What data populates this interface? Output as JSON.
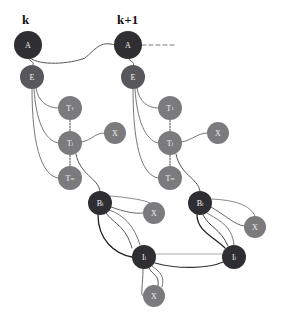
{
  "diagram": {
    "columns": [
      {
        "label": "k",
        "x": 28
      },
      {
        "label": "k+1",
        "x": 128
      }
    ],
    "colors": {
      "dark": "#2f2f33",
      "mid": "#58585c",
      "grey": "#7b7b7e",
      "edge": "#444444",
      "edge_light": "#8a8a8a"
    },
    "nodes": [
      {
        "id": "A_k",
        "label": "A",
        "sup": "",
        "x": 28,
        "y": 45,
        "r": 14,
        "tone": "dark"
      },
      {
        "id": "E_k",
        "label": "E",
        "sup": "",
        "x": 32,
        "y": 77,
        "r": 12,
        "tone": "mid"
      },
      {
        "id": "T1_k",
        "label": "T",
        "sup": "1",
        "x": 70,
        "y": 108,
        "r": 12,
        "tone": "grey"
      },
      {
        "id": "Tj_k",
        "label": "T",
        "sup": "j",
        "x": 70,
        "y": 143,
        "r": 12,
        "tone": "grey"
      },
      {
        "id": "X1_k",
        "label": "X",
        "sup": "",
        "x": 115,
        "y": 133,
        "r": 11,
        "tone": "grey"
      },
      {
        "id": "Tm_k",
        "label": "T",
        "sup": "m",
        "x": 70,
        "y": 178,
        "r": 12,
        "tone": "grey"
      },
      {
        "id": "Bj_k",
        "label": "B",
        "sup": "j",
        "x": 100,
        "y": 203,
        "r": 12,
        "tone": "dark"
      },
      {
        "id": "X2_k",
        "label": "X",
        "sup": "",
        "x": 154,
        "y": 213,
        "r": 11,
        "tone": "grey"
      },
      {
        "id": "Ij_k",
        "label": "I",
        "sup": "j",
        "x": 144,
        "y": 257,
        "r": 12,
        "tone": "dark"
      },
      {
        "id": "X3_k",
        "label": "X",
        "sup": "",
        "x": 154,
        "y": 296,
        "r": 11,
        "tone": "grey"
      },
      {
        "id": "A_k1",
        "label": "A",
        "sup": "",
        "x": 128,
        "y": 45,
        "r": 14,
        "tone": "dark"
      },
      {
        "id": "E_k1",
        "label": "E",
        "sup": "",
        "x": 133,
        "y": 77,
        "r": 12,
        "tone": "mid"
      },
      {
        "id": "T1_k1",
        "label": "T",
        "sup": "1",
        "x": 170,
        "y": 108,
        "r": 12,
        "tone": "grey"
      },
      {
        "id": "Tj_k1",
        "label": "T",
        "sup": "j",
        "x": 170,
        "y": 143,
        "r": 12,
        "tone": "grey"
      },
      {
        "id": "X1_k1",
        "label": "X",
        "sup": "",
        "x": 218,
        "y": 133,
        "r": 11,
        "tone": "grey"
      },
      {
        "id": "Tm_k1",
        "label": "T",
        "sup": "m",
        "x": 170,
        "y": 178,
        "r": 12,
        "tone": "grey"
      },
      {
        "id": "Bj_k1",
        "label": "B",
        "sup": "j",
        "x": 200,
        "y": 203,
        "r": 12,
        "tone": "dark"
      },
      {
        "id": "X2_k1",
        "label": "X",
        "sup": "",
        "x": 255,
        "y": 227,
        "r": 11,
        "tone": "grey"
      },
      {
        "id": "Ij_k1",
        "label": "I",
        "sup": "j",
        "x": 234,
        "y": 257,
        "r": 12,
        "tone": "dark"
      }
    ]
  }
}
